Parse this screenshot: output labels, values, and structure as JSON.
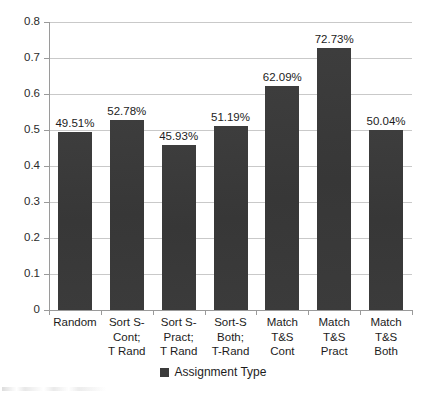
{
  "chart_data": {
    "type": "bar",
    "title": "",
    "xlabel": "",
    "ylabel": "",
    "ylim": [
      0,
      0.8
    ],
    "ytick_labels": [
      "0.8",
      "0.7",
      "0.6",
      "0.5",
      "0.4",
      "0.3",
      "0.2",
      "0.1",
      "0"
    ],
    "ytick_values": [
      0.8,
      0.7,
      0.6,
      0.5,
      0.4,
      0.3,
      0.2,
      0.1,
      0
    ],
    "grid": true,
    "legend_position": "bottom",
    "series_color": "#3b3b3b",
    "categories": [
      "Random",
      "Sort S-\nCont;\nT Rand",
      "Sort S-\nPract;\nT Rand",
      "Sort-S\nBoth;\nT-Rand",
      "Match\nT&S\nCont",
      "Match\nT&S\nPract",
      "Match\nT&S\nBoth"
    ],
    "category_lines": [
      [
        "Random"
      ],
      [
        "Sort S-",
        "Cont;",
        "T Rand"
      ],
      [
        "Sort S-",
        "Pract;",
        "T Rand"
      ],
      [
        "Sort-S",
        "Both;",
        "T-Rand"
      ],
      [
        "Match",
        "T&S",
        "Cont"
      ],
      [
        "Match",
        "T&S",
        "Pract"
      ],
      [
        "Match",
        "T&S",
        "Both"
      ]
    ],
    "series": [
      {
        "name": "Assignment Type",
        "values": [
          0.4951,
          0.5278,
          0.4593,
          0.5119,
          0.6209,
          0.7273,
          0.5004
        ],
        "data_labels": [
          "49.51%",
          "52.78%",
          "45.93%",
          "51.19%",
          "62.09%",
          "72.73%",
          "50.04%"
        ]
      }
    ]
  },
  "legend": {
    "entries": [
      {
        "label": "Assignment Type",
        "color": "#3b3b3b"
      }
    ]
  }
}
